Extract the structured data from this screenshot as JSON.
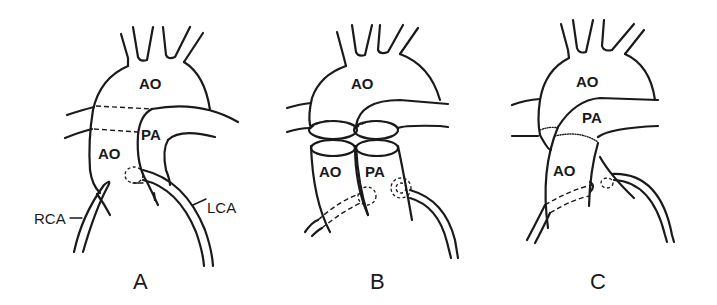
{
  "figure": {
    "panels": [
      {
        "id": "A",
        "label": "A",
        "structures": {
          "ao_upper": "AO",
          "ao_lower": "AO",
          "pa": "PA",
          "rca": "RCA",
          "lca": "LCA"
        }
      },
      {
        "id": "B",
        "label": "B",
        "structures": {
          "ao_upper": "AO",
          "ao_lower": "AO",
          "pa": "PA"
        }
      },
      {
        "id": "C",
        "label": "C",
        "structures": {
          "ao_upper": "AO",
          "pa": "PA",
          "ao_lower": "AO"
        }
      }
    ],
    "stroke_color": "#1a1a1a",
    "background_color": "#ffffff"
  }
}
